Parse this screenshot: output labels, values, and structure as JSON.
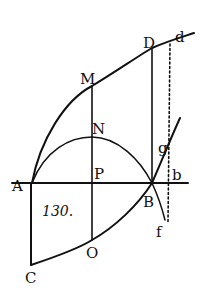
{
  "figure": {
    "number": "130.",
    "labels": {
      "A": "A",
      "B": "B",
      "C": "C",
      "D": "D",
      "M": "M",
      "N": "N",
      "O": "O",
      "P": "P",
      "b": "b",
      "d": "d",
      "f": "f",
      "g": "g"
    },
    "colors": {
      "ink": "#111111",
      "paper": "#ffffff"
    }
  }
}
